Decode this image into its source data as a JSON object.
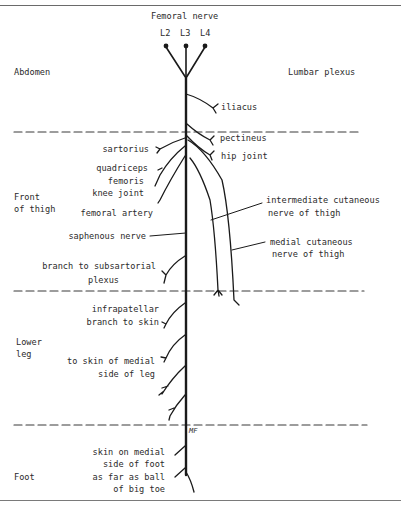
{
  "title": "Femoral nerve",
  "roots": [
    "L2",
    "L3",
    "L4"
  ],
  "regions": {
    "abdomen": "Abdomen",
    "lumbar_plexus": "Lumbar plexus",
    "front_of_thigh": [
      "Front",
      "of thigh"
    ],
    "lower_leg": [
      "Lower",
      "leg"
    ],
    "foot": "Foot"
  },
  "branches": {
    "iliacus": "iliacus",
    "pectineus": "pectineus",
    "hip_joint": "hip joint",
    "sartorius": "sartorius",
    "quadriceps_femoris": [
      "quadriceps",
      "femoris"
    ],
    "knee_joint": "knee joint",
    "femoral_artery": "femoral artery",
    "intermediate_cutaneous": [
      "intermediate cutaneous",
      "nerve of thigh"
    ],
    "medial_cutaneous": [
      "medial cutaneous",
      "nerve of thigh"
    ],
    "saphenous_nerve": "saphenous nerve",
    "subsartorial": [
      "branch to subsartorial",
      "plexus"
    ],
    "infrapatellar": [
      "infrapatellar",
      "branch to skin"
    ],
    "medial_leg_skin": [
      "to skin of medial",
      "side of leg"
    ],
    "foot_skin": [
      "skin on medial",
      "side of foot",
      "as far as ball",
      "of big toe"
    ]
  },
  "mark": "MF",
  "colors": {
    "ink": "#1a1a1a",
    "border": "#6a6a6a",
    "dash": "#3a3a3a"
  }
}
